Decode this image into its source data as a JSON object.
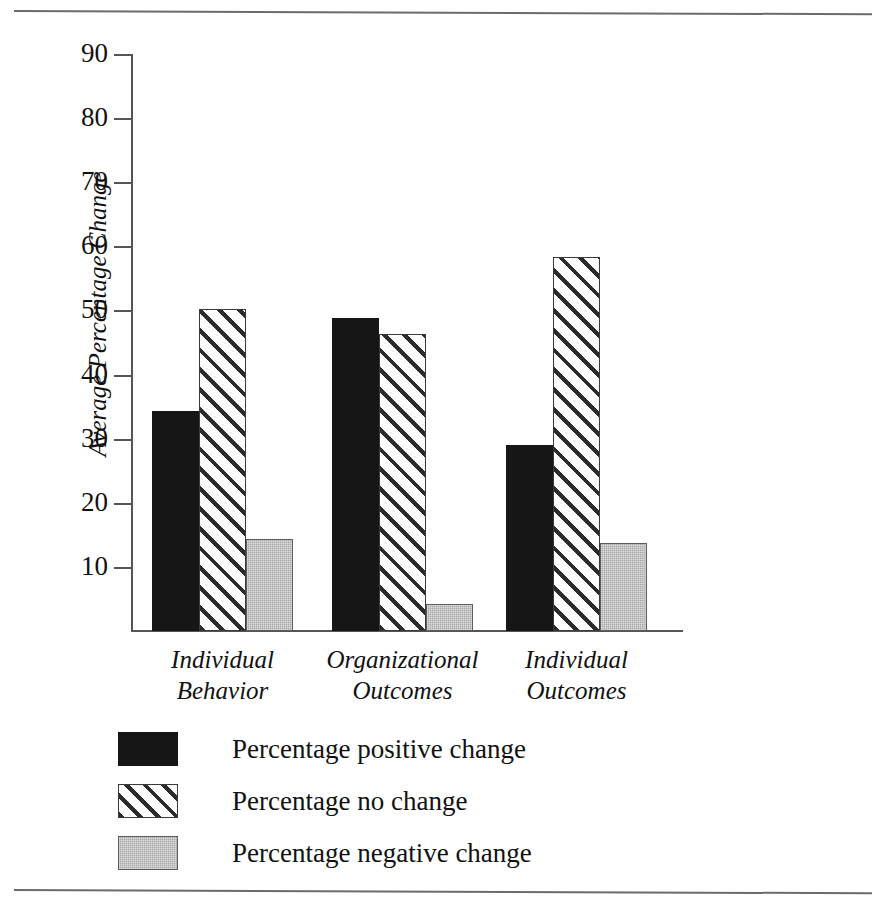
{
  "chart_data": {
    "type": "bar",
    "title": "",
    "subtitle": "",
    "xlabel": "",
    "ylabel": "Average Percentage Change",
    "ylim": [
      0,
      90
    ],
    "ytick_values": [
      90,
      80,
      70,
      60,
      50,
      40,
      30,
      20,
      10
    ],
    "ytick_labels": [
      "90",
      "80",
      "70",
      "60",
      "50",
      "40",
      "30",
      "20",
      "10"
    ],
    "grid": false,
    "legend_position": "bottom-left",
    "categories": [
      "Individual Behavior",
      "Organizational Outcomes",
      "Individual Outcomes"
    ],
    "category_lines": [
      [
        "Individual",
        "Behavior"
      ],
      [
        "Organizational",
        "Outcomes"
      ],
      [
        "Individual",
        "Outcomes"
      ]
    ],
    "series": [
      {
        "name": "Percentage positive change",
        "key": "positive",
        "fill": "solid-black",
        "color": "#161616",
        "values": [
          34.3,
          48.8,
          29.0
        ]
      },
      {
        "name": "Percentage no change",
        "key": "nochange",
        "fill": "diagonal-hatch",
        "color": "#2b2b2b",
        "values": [
          50.2,
          46.3,
          58.4
        ]
      },
      {
        "name": "Percentage negative change",
        "key": "negative",
        "fill": "gray-stipple",
        "color": "#a8a8a8",
        "values": [
          14.3,
          4.2,
          13.7
        ]
      }
    ]
  },
  "legend": {
    "items": [
      {
        "label": "Percentage positive change",
        "swatch": "positive"
      },
      {
        "label": "Percentage no change",
        "swatch": "nochange"
      },
      {
        "label": "Percentage negative change",
        "swatch": "negative"
      }
    ]
  }
}
